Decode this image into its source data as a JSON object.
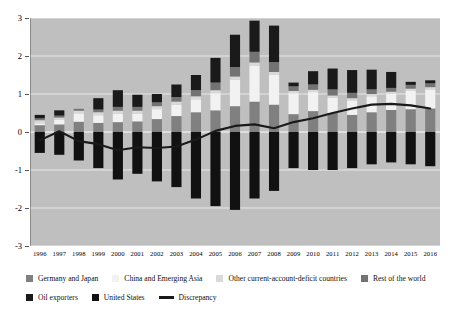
{
  "chart_data": {
    "type": "bar",
    "stacked": true,
    "title": "",
    "subtitle": "",
    "xlabel": "",
    "ylabel": "",
    "ylim": [
      -3,
      3
    ],
    "yticks": [
      3,
      2,
      1,
      0,
      -1,
      -2,
      -3
    ],
    "ytick_labels": [
      "3",
      "2",
      "1",
      "0",
      "-1",
      "-2",
      "-3"
    ],
    "grid": true,
    "legend_position": "bottom",
    "categories": [
      "1996",
      "1997",
      "1998",
      "1999",
      "2000",
      "2001",
      "2002",
      "2003",
      "2004",
      "2005",
      "2006",
      "2007",
      "2008",
      "2009",
      "2010",
      "2011",
      "2012",
      "2013",
      "2014",
      "2015",
      "2016"
    ],
    "series": [
      {
        "name": "Germany and Japan",
        "color": "#808080",
        "values": [
          0.18,
          0.2,
          0.27,
          0.24,
          0.26,
          0.28,
          0.34,
          0.42,
          0.52,
          0.57,
          0.68,
          0.8,
          0.72,
          0.47,
          0.55,
          0.5,
          0.45,
          0.52,
          0.58,
          0.6,
          0.62
        ]
      },
      {
        "name": "China and Emerging Asia",
        "color": "#f2f2f2",
        "values": [
          0.05,
          0.12,
          0.22,
          0.2,
          0.22,
          0.2,
          0.26,
          0.3,
          0.34,
          0.45,
          0.7,
          0.95,
          0.78,
          0.55,
          0.5,
          0.4,
          0.38,
          0.42,
          0.42,
          0.48,
          0.5
        ]
      },
      {
        "name": "Other current-account-deficit countries",
        "color": "#d9d9d9",
        "values": [
          0.08,
          0.06,
          0.07,
          0.08,
          0.08,
          0.08,
          0.08,
          0.08,
          0.08,
          0.08,
          0.08,
          0.08,
          0.08,
          0.06,
          0.06,
          0.06,
          0.06,
          0.06,
          0.06,
          0.06,
          0.06
        ]
      },
      {
        "name": "Rest of the world",
        "color": "#737373",
        "values": [
          0.05,
          0.05,
          0.05,
          0.07,
          0.1,
          0.1,
          0.1,
          0.12,
          0.16,
          0.2,
          0.25,
          0.28,
          0.26,
          0.12,
          0.14,
          0.16,
          0.14,
          0.12,
          0.1,
          0.1,
          0.1
        ]
      },
      {
        "name": "Oil exporters",
        "color": "#1a1a1a",
        "values": [
          0.09,
          0.14,
          0.0,
          0.3,
          0.44,
          0.32,
          0.22,
          0.33,
          0.4,
          0.65,
          0.85,
          0.82,
          0.96,
          0.1,
          0.35,
          0.55,
          0.6,
          0.52,
          0.42,
          0.08,
          0.08
        ]
      },
      {
        "name": "United States",
        "color": "#111111",
        "values": [
          -0.55,
          -0.6,
          -0.75,
          -0.95,
          -1.25,
          -1.1,
          -1.3,
          -1.45,
          -1.75,
          -1.95,
          -2.05,
          -1.75,
          -1.55,
          -0.95,
          -1.0,
          -1.0,
          -0.95,
          -0.85,
          -0.8,
          -0.85,
          -0.9
        ]
      }
    ],
    "line_series": {
      "name": "Discrepancy",
      "color": "#1a1a1a",
      "values": [
        -0.22,
        0.02,
        -0.24,
        -0.32,
        -0.48,
        -0.4,
        -0.42,
        -0.38,
        -0.2,
        0.03,
        0.16,
        0.2,
        0.1,
        0.26,
        0.36,
        0.5,
        0.62,
        0.72,
        0.74,
        0.7,
        0.62
      ]
    }
  },
  "legend": {
    "rows": [
      [
        {
          "label": "Germany and Japan",
          "marker": "swatch",
          "color": "#808080"
        },
        {
          "label": "China and Emerging Asia",
          "marker": "swatch",
          "color": "#f2f2f2"
        },
        {
          "label": "Other current-account-deficit countries",
          "marker": "swatch",
          "color": "#d9d9d9"
        },
        {
          "label": "Rest of the world",
          "marker": "swatch",
          "color": "#737373"
        }
      ],
      [
        {
          "label": "Oil exporters",
          "marker": "swatch",
          "color": "#1a1a1a"
        },
        {
          "label": "United States",
          "marker": "swatch",
          "color": "#111111"
        },
        {
          "label": "Discrepancy",
          "marker": "line",
          "color": "#1a1a1a"
        }
      ]
    ]
  },
  "colors": {
    "plot_background": "#bfbfbf",
    "page_background": "#ffffff",
    "gridline": "#e8e8e8",
    "axis": "#555555"
  }
}
